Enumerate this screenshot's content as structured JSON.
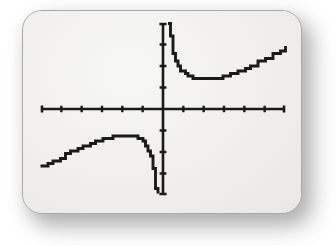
{
  "device": {
    "name": "graphing-calculator-screen",
    "screen_background": "#f0efed",
    "bezel_color": "#a9a9a9",
    "ink_color": "#1a1a1a"
  },
  "chart_data": {
    "type": "line",
    "title": "",
    "subtitle": "",
    "xlabel": "",
    "ylabel": "",
    "grid": false,
    "legend": null,
    "legend_position": "none",
    "axis_style": "calculator-crosshair",
    "xlim": [
      -6,
      6
    ],
    "ylim": [
      -4,
      4
    ],
    "xticks": [
      -5,
      -4,
      -3,
      -2,
      -1,
      1,
      2,
      3,
      4,
      5
    ],
    "yticks": [
      -3,
      -2,
      -1,
      1,
      2,
      3
    ],
    "tick_count_x": 10,
    "tick_count_y": 6,
    "vertical_asymptote": 0,
    "series": [
      {
        "name": "branch-right",
        "x": [
          0.3,
          0.38,
          0.46,
          0.55,
          0.66,
          0.78,
          0.92,
          1.08,
          1.26,
          1.48,
          1.72,
          2.0,
          2.3,
          2.62,
          2.95,
          3.3,
          3.65,
          4.0,
          4.35,
          4.7,
          5.05,
          5.4,
          5.72,
          6.0
        ],
        "y": [
          3.95,
          3.45,
          3.0,
          2.6,
          2.25,
          1.98,
          1.76,
          1.6,
          1.5,
          1.44,
          1.41,
          1.4,
          1.41,
          1.44,
          1.5,
          1.6,
          1.72,
          1.86,
          2.02,
          2.18,
          2.36,
          2.55,
          2.74,
          2.92
        ]
      },
      {
        "name": "branch-left",
        "x": [
          -6.0,
          -5.7,
          -5.4,
          -5.1,
          -4.8,
          -4.5,
          -4.2,
          -3.9,
          -3.6,
          -3.3,
          -3.0,
          -2.7,
          -2.4,
          -2.1,
          -1.85,
          -1.62,
          -1.42,
          -1.24,
          -1.08,
          -0.94,
          -0.82,
          -0.72,
          -0.63,
          -0.55,
          -0.48,
          -0.42,
          -0.36,
          -0.31,
          -0.27
        ],
        "y": [
          -2.7,
          -2.55,
          -2.4,
          -2.26,
          -2.12,
          -1.98,
          -1.85,
          -1.72,
          -1.6,
          -1.49,
          -1.4,
          -1.33,
          -1.28,
          -1.25,
          -1.24,
          -1.25,
          -1.28,
          -1.33,
          -1.42,
          -1.54,
          -1.7,
          -1.9,
          -2.14,
          -2.42,
          -2.74,
          -3.08,
          -3.42,
          -3.72,
          -3.95
        ]
      }
    ]
  }
}
